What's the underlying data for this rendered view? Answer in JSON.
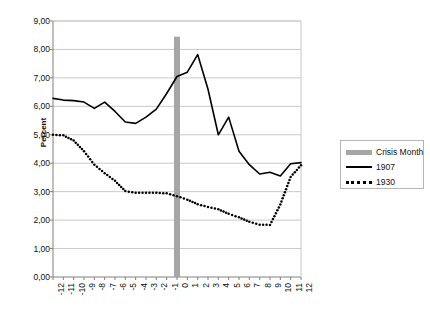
{
  "chart_data": {
    "type": "line",
    "title": "",
    "xlabel": "",
    "ylabel": "Percent",
    "xlim": [
      -12,
      12
    ],
    "ylim": [
      0,
      9
    ],
    "grid": true,
    "legend_position": "right",
    "x": [
      -12,
      -11,
      -10,
      -9,
      -8,
      -7,
      -6,
      -5,
      -4,
      -3,
      -2,
      -1,
      0,
      1,
      2,
      3,
      4,
      5,
      6,
      7,
      8,
      9,
      10,
      11,
      12
    ],
    "x_tick_labels": [
      "-12",
      "-11",
      "-10",
      "-9",
      "-8",
      "-7",
      "-6",
      "-5",
      "-4",
      "-3",
      "-2",
      "-1",
      "0",
      "1",
      "2",
      "3",
      "4",
      "5",
      "6",
      "7",
      "8",
      "9",
      "10",
      "11",
      "12"
    ],
    "y_tick_labels": [
      "0,00",
      "1,00",
      "2,00",
      "3,00",
      "4,00",
      "5,00",
      "6,00",
      "7,00",
      "8,00",
      "9,00"
    ],
    "y_tick_values": [
      0,
      1,
      2,
      3,
      4,
      5,
      6,
      7,
      8,
      9
    ],
    "series": [
      {
        "name": "1907",
        "style": "solid",
        "color": "#000000",
        "values": [
          6.28,
          6.22,
          6.2,
          6.15,
          5.93,
          6.15,
          5.82,
          5.45,
          5.4,
          5.62,
          5.9,
          6.45,
          7.05,
          7.2,
          7.82,
          6.6,
          5.0,
          5.62,
          4.42,
          3.95,
          3.62,
          3.68,
          3.55,
          3.98,
          4.02
        ]
      },
      {
        "name": "1930",
        "style": "dotted",
        "color": "#000000",
        "values": [
          5.0,
          4.98,
          4.8,
          4.42,
          3.95,
          3.65,
          3.38,
          3.02,
          2.96,
          2.96,
          2.96,
          2.94,
          2.84,
          2.72,
          2.56,
          2.46,
          2.38,
          2.22,
          2.1,
          1.94,
          1.84,
          1.83,
          2.55,
          3.52,
          3.93
        ]
      }
    ],
    "annotations": [
      {
        "name": "crisis-month",
        "type": "vline",
        "x": 0,
        "label": "Crisis Month",
        "color": "#a6a6a6",
        "y_top": 8.45,
        "y_bottom": 0
      }
    ],
    "legend": [
      {
        "label": "Crisis Month",
        "marker": "band",
        "color": "#a6a6a6"
      },
      {
        "label": "1907",
        "marker": "line",
        "color": "#000000"
      },
      {
        "label": "1930",
        "marker": "dotted",
        "color": "#000000"
      }
    ]
  },
  "plot": {
    "left": 53,
    "right": 301,
    "top": 21,
    "bottom": 277
  },
  "colors": {
    "grid": "#c9c9c9",
    "axis": "#808080",
    "series": "#000000",
    "crisis": "#a6a6a6",
    "background": "#ffffff"
  }
}
